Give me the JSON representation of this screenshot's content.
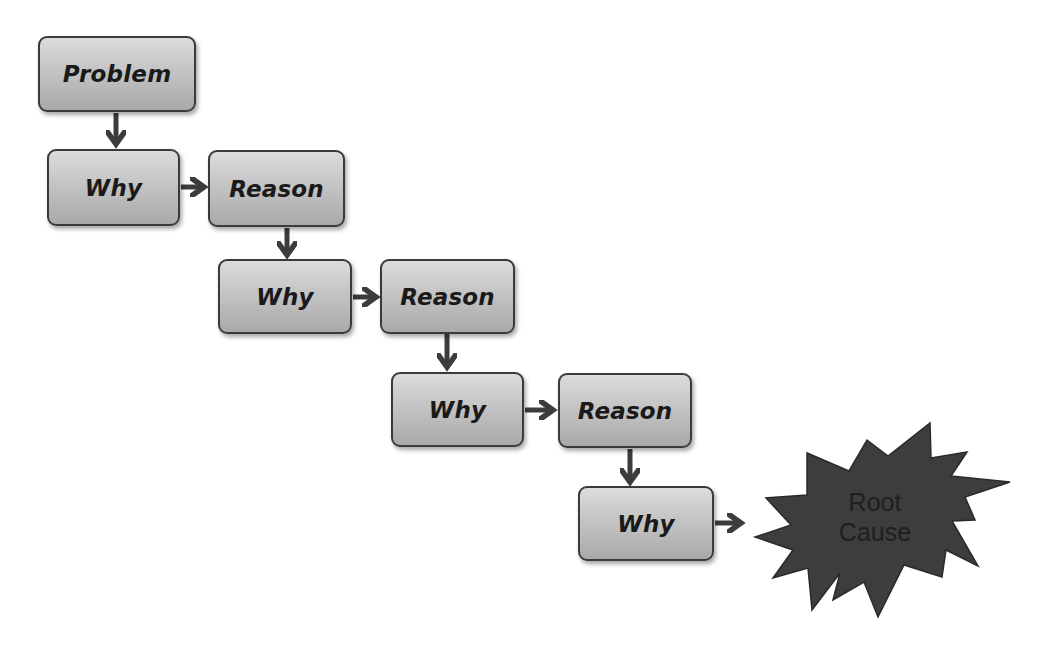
{
  "diagram": {
    "nodes": [
      {
        "id": "problem",
        "label": "Problem"
      },
      {
        "id": "why1",
        "label": "Why"
      },
      {
        "id": "reason1",
        "label": "Reason"
      },
      {
        "id": "why2",
        "label": "Why"
      },
      {
        "id": "reason2",
        "label": "Reason"
      },
      {
        "id": "why3",
        "label": "Why"
      },
      {
        "id": "reason3",
        "label": "Reason"
      },
      {
        "id": "why4",
        "label": "Why"
      },
      {
        "id": "root_cause",
        "label_line1": "Root",
        "label_line2": "Cause",
        "shape": "starburst"
      }
    ],
    "edges": [
      [
        "problem",
        "why1"
      ],
      [
        "why1",
        "reason1"
      ],
      [
        "reason1",
        "why2"
      ],
      [
        "why2",
        "reason2"
      ],
      [
        "reason2",
        "why3"
      ],
      [
        "why3",
        "reason3"
      ],
      [
        "reason3",
        "why4"
      ],
      [
        "why4",
        "root_cause"
      ]
    ],
    "colors": {
      "box_top": "#dcdcdc",
      "box_bottom": "#a9a9a9",
      "border": "#3a3a3a",
      "arrow": "#3c3c3c",
      "starburst": "#3d3d3d"
    }
  }
}
